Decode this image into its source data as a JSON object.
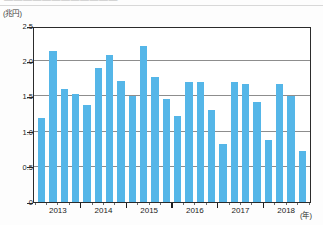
{
  "headline": {
    "text": "————————————"
  },
  "axis": {
    "y_unit": "(兆円)",
    "x_unit": "(年)"
  },
  "chart_data": {
    "type": "bar",
    "title": "",
    "subtitle": "",
    "xlabel": "(年)",
    "ylabel": "(兆円)",
    "ylim": [
      0,
      2.5
    ],
    "yticks": [
      0,
      0.5,
      1.0,
      1.5,
      2.0,
      2.5
    ],
    "ytick_labels": [
      "0",
      "0.5",
      "1.0",
      "1.5",
      "2.0",
      "2.5"
    ],
    "grid": true,
    "legend": "none",
    "bar_color": "#55b6e8",
    "categories": [
      "2013 Q1",
      "2013 Q2",
      "2013 Q3",
      "2013 Q4",
      "2014 Q1",
      "2014 Q2",
      "2014 Q3",
      "2014 Q4",
      "2015 Q1",
      "2015 Q2",
      "2015 Q3",
      "2015 Q4",
      "2016 Q1",
      "2016 Q2",
      "2016 Q3",
      "2016 Q4",
      "2017 Q1",
      "2017 Q2",
      "2017 Q3",
      "2017 Q4",
      "2018 Q1",
      "2018 Q2",
      "2018 Q3",
      "2018 Q4"
    ],
    "values": [
      1.2,
      2.15,
      1.6,
      1.53,
      1.38,
      1.9,
      2.09,
      1.72,
      1.5,
      2.22,
      1.78,
      1.47,
      1.22,
      1.7,
      1.71,
      1.3,
      0.83,
      1.7,
      1.68,
      1.42,
      0.88,
      1.68,
      1.5,
      0.72
    ],
    "year_groups": [
      "2013",
      "2014",
      "2015",
      "2016",
      "2017",
      "2018"
    ],
    "bars_per_group": 4
  }
}
